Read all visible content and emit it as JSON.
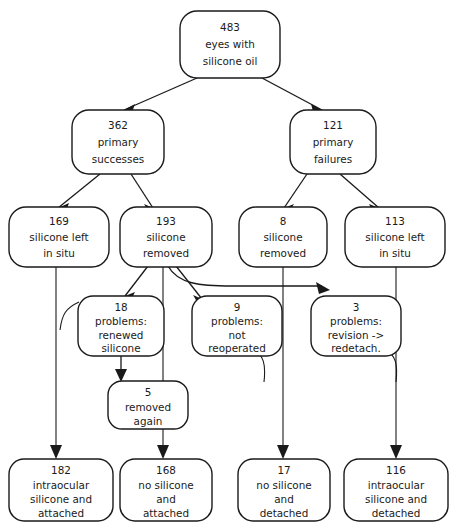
{
  "diagram": {
    "type": "flowchart",
    "orientation": "top-down",
    "colors": {
      "background": "#ffffff",
      "stroke": "#1a1a1a",
      "text": "#1a1a1a"
    },
    "nodes": [
      {
        "id": "root",
        "count": "483",
        "lines": [
          "483",
          "eyes with",
          "silicone oil"
        ],
        "level": 0
      },
      {
        "id": "primary-successes",
        "count": "362",
        "lines": [
          "362",
          "primary",
          "successes"
        ],
        "level": 1
      },
      {
        "id": "primary-failures",
        "count": "121",
        "lines": [
          "121",
          "primary",
          "failures"
        ],
        "level": 1
      },
      {
        "id": "success-silicone-left",
        "count": "169",
        "lines": [
          "169",
          "silicone left",
          "in situ"
        ],
        "level": 2
      },
      {
        "id": "success-silicone-removed",
        "count": "193",
        "lines": [
          "193",
          "silicone",
          "removed"
        ],
        "level": 2
      },
      {
        "id": "failure-silicone-removed",
        "count": "8",
        "lines": [
          "8",
          "silicone",
          "removed"
        ],
        "level": 2
      },
      {
        "id": "failure-silicone-left",
        "count": "113",
        "lines": [
          "113",
          "silicone left",
          "in situ"
        ],
        "level": 2
      },
      {
        "id": "problems-renewed",
        "count": "18",
        "lines": [
          "18",
          "problems:",
          "renewed",
          "silicone"
        ],
        "level": 3
      },
      {
        "id": "problems-not-reoperated",
        "count": "9",
        "lines": [
          "9",
          "problems:",
          "not",
          "reoperated"
        ],
        "level": 3
      },
      {
        "id": "problems-revision",
        "count": "3",
        "lines": [
          "3",
          "problems:",
          "revision ->",
          "redetach."
        ],
        "level": 3
      },
      {
        "id": "removed-again",
        "count": "5",
        "lines": [
          "5",
          "removed",
          "again"
        ],
        "level": 4
      },
      {
        "id": "outcome-intraocular-attached",
        "count": "182",
        "lines": [
          "182",
          "intraocular",
          "silicone and",
          "attached"
        ],
        "level": 5
      },
      {
        "id": "outcome-no-silicone-attached",
        "count": "168",
        "lines": [
          "168",
          "no silicone",
          "and",
          "attached"
        ],
        "level": 5
      },
      {
        "id": "outcome-no-silicone-detached",
        "count": "17",
        "lines": [
          "17",
          "no silicone",
          "and",
          "detached"
        ],
        "level": 5
      },
      {
        "id": "outcome-intraocular-detached",
        "count": "116",
        "lines": [
          "116",
          "intraocular",
          "silicone and",
          "detached"
        ],
        "level": 5
      }
    ],
    "edges": [
      {
        "from": "root",
        "to": "primary-successes"
      },
      {
        "from": "root",
        "to": "primary-failures"
      },
      {
        "from": "primary-successes",
        "to": "success-silicone-left"
      },
      {
        "from": "primary-successes",
        "to": "success-silicone-removed"
      },
      {
        "from": "primary-failures",
        "to": "failure-silicone-removed"
      },
      {
        "from": "primary-failures",
        "to": "failure-silicone-left"
      },
      {
        "from": "success-silicone-left",
        "to": "outcome-intraocular-attached"
      },
      {
        "from": "success-silicone-removed",
        "to": "problems-renewed"
      },
      {
        "from": "success-silicone-removed",
        "to": "problems-not-reoperated"
      },
      {
        "from": "success-silicone-removed",
        "to": "problems-revision"
      },
      {
        "from": "success-silicone-removed",
        "to": "outcome-no-silicone-attached"
      },
      {
        "from": "problems-renewed",
        "to": "removed-again"
      },
      {
        "from": "removed-again",
        "to": "outcome-no-silicone-attached"
      },
      {
        "from": "problems-renewed",
        "to": "outcome-intraocular-attached"
      },
      {
        "from": "problems-not-reoperated",
        "to": "outcome-no-silicone-detached"
      },
      {
        "from": "failure-silicone-removed",
        "to": "outcome-no-silicone-detached"
      },
      {
        "from": "problems-revision",
        "to": "outcome-intraocular-detached"
      },
      {
        "from": "failure-silicone-left",
        "to": "outcome-intraocular-detached"
      }
    ]
  }
}
